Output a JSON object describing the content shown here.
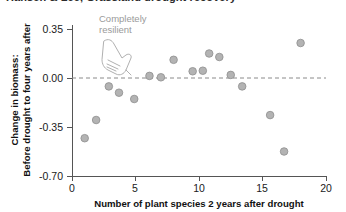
{
  "panel": {
    "title": "Hansen & Lee, Grassland drought recovery"
  },
  "chart_data": {
    "type": "scatter",
    "title": "",
    "xlabel": "Number of plant species 2 years after drought",
    "ylabel": "Change in biomass:\nBefore drought to four years after",
    "ylabel_line1": "Change in biomass:",
    "ylabel_line2": "Before drought to four years after",
    "xlim": [
      0,
      20
    ],
    "ylim": [
      -0.7,
      0.35
    ],
    "xticks": [
      0,
      5,
      10,
      15,
      20
    ],
    "xtick_labels": [
      "0",
      "5",
      "10",
      "15",
      "20"
    ],
    "yticks": [
      0.35,
      0.0,
      -0.35,
      -0.7
    ],
    "ytick_labels": [
      "0.35",
      "0.00",
      "-0.35",
      "-0.70"
    ],
    "grid": false,
    "legend": false,
    "reference_lines": [
      {
        "name": "zero-change-line",
        "axis": "y",
        "value": 0.0,
        "style": "dashed"
      }
    ],
    "annotations": [
      {
        "name": "completely-resilient-annotation",
        "line1": "Completely",
        "line2": "resilient",
        "x": 2.1,
        "y": 0.33,
        "pointer": "hand-pointing-down-right",
        "points_to_y": 0.0
      }
    ],
    "marker": {
      "shape": "circle",
      "fill": "#b3b3b3",
      "edge": "#8e8e8e",
      "size": 5.2
    },
    "points": [
      {
        "x": 1.0,
        "y": -0.43
      },
      {
        "x": 1.9,
        "y": -0.3
      },
      {
        "x": 2.9,
        "y": -0.06
      },
      {
        "x": 3.7,
        "y": -0.105
      },
      {
        "x": 4.9,
        "y": -0.15
      },
      {
        "x": 6.1,
        "y": 0.015
      },
      {
        "x": 7.0,
        "y": 0.005
      },
      {
        "x": 8.0,
        "y": 0.13
      },
      {
        "x": 9.5,
        "y": 0.048
      },
      {
        "x": 10.3,
        "y": 0.052
      },
      {
        "x": 10.8,
        "y": 0.175
      },
      {
        "x": 11.6,
        "y": 0.15
      },
      {
        "x": 12.5,
        "y": 0.022
      },
      {
        "x": 13.4,
        "y": -0.06
      },
      {
        "x": 15.6,
        "y": -0.265
      },
      {
        "x": 16.7,
        "y": -0.525
      },
      {
        "x": 18.0,
        "y": 0.25
      }
    ]
  }
}
